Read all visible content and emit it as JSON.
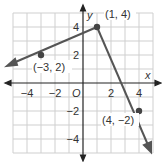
{
  "graph": {
    "x_axis_label": "x",
    "y_axis_label": "y",
    "origin_label": "O",
    "x_ticks": [
      {
        "value": -4,
        "label": "−4"
      },
      {
        "value": -2,
        "label": "−2"
      },
      {
        "value": 2,
        "label": "2"
      },
      {
        "value": 4,
        "label": "4"
      }
    ],
    "y_ticks": [
      {
        "value": 4,
        "label": "4"
      },
      {
        "value": 2,
        "label": "2"
      },
      {
        "value": -2,
        "label": "−2"
      },
      {
        "value": -4,
        "label": "−4"
      }
    ],
    "points": [
      {
        "x": -3,
        "y": 2,
        "label": "(−3, 2)"
      },
      {
        "x": 1,
        "y": 4,
        "label": "(1, 4)"
      },
      {
        "x": 4,
        "y": -2,
        "label": "(4, −2)"
      }
    ],
    "colors": {
      "grid": "#cfcfcf",
      "axis": "#222222",
      "line": "#555555",
      "point": "#444444"
    }
  }
}
